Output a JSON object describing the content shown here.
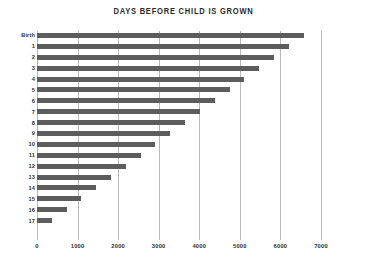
{
  "chart_data": {
    "type": "bar",
    "orientation": "horizontal",
    "title": "DAYS BEFORE CHILD IS GROWN",
    "xlabel": "",
    "ylabel": "",
    "categories": [
      "Birth",
      "1",
      "2",
      "3",
      "4",
      "5",
      "6",
      "7",
      "8",
      "9",
      "10",
      "11",
      "12",
      "13",
      "14",
      "15",
      "16",
      "17"
    ],
    "values": [
      6570,
      6205,
      5840,
      5475,
      5110,
      4745,
      4380,
      4015,
      3650,
      3285,
      2920,
      2555,
      2190,
      1825,
      1460,
      1095,
      730,
      365
    ],
    "xlim": [
      0,
      7000
    ],
    "xticks": [
      0,
      1000,
      2000,
      3000,
      4000,
      5000,
      6000,
      7000
    ],
    "xticklabels": [
      "0",
      "1000",
      "2000",
      "3000",
      "4000",
      "5000",
      "6000",
      "7000"
    ],
    "grid": true,
    "grid_axis": "x",
    "legend": false,
    "bar_color": "#5d5d5d",
    "grid_color": "#b9b9b9",
    "text_color": "#2f2f2f",
    "background": "#ffffff"
  }
}
